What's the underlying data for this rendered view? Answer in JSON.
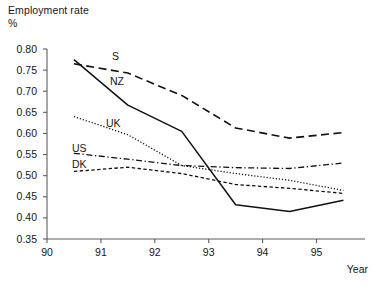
{
  "figure": {
    "title_line1": "Employment rate",
    "title_line2": "%",
    "xaxis_title": "Year"
  },
  "chart_data": {
    "type": "line",
    "title": "Employment rate",
    "subtitle": "%",
    "xlabel": "Year",
    "ylabel": "%",
    "xlim": [
      90,
      95.9
    ],
    "ylim": [
      0.35,
      0.8
    ],
    "grid": false,
    "legend": "inline-labels",
    "xticks": [
      90,
      91,
      92,
      93,
      94,
      95
    ],
    "xtick_labels": [
      "90",
      "91",
      "92",
      "93",
      "94",
      "95"
    ],
    "yticks": [
      0.35,
      0.4,
      0.45,
      0.5,
      0.55,
      0.6,
      0.65,
      0.7,
      0.75,
      0.8
    ],
    "ytick_labels": [
      "0.35",
      "0.40",
      "0.45",
      "0.50",
      "0.55",
      "0.60",
      "0.65",
      "0.70",
      "0.75",
      "0.80"
    ],
    "x": [
      90.5,
      91.5,
      92.5,
      93.5,
      94.5,
      95.5
    ],
    "series": [
      {
        "name": "S",
        "label": "S",
        "style": "dashed",
        "color": "#111111",
        "values": [
          0.765,
          0.743,
          0.69,
          0.613,
          0.589,
          0.602
        ]
      },
      {
        "name": "NZ",
        "label": "NZ",
        "style": "solid",
        "color": "#111111",
        "values": [
          0.775,
          0.667,
          0.605,
          0.431,
          0.415,
          0.442
        ]
      },
      {
        "name": "UK",
        "label": "UK",
        "style": "dotted",
        "color": "#111111",
        "values": [
          0.64,
          0.597,
          0.524,
          0.505,
          0.489,
          0.465
        ]
      },
      {
        "name": "US",
        "label": "US",
        "style": "dash-dot",
        "color": "#111111",
        "values": [
          0.553,
          0.539,
          0.524,
          0.519,
          0.517,
          0.53
        ]
      },
      {
        "name": "DK",
        "label": "DK",
        "style": "dashed-short",
        "color": "#111111",
        "values": [
          0.51,
          0.52,
          0.505,
          0.479,
          0.47,
          0.458
        ]
      }
    ],
    "series_label_positions": [
      {
        "name": "S",
        "x": 112,
        "y": 60
      },
      {
        "name": "NZ",
        "x": 110,
        "y": 85
      },
      {
        "name": "UK",
        "x": 106,
        "y": 127
      },
      {
        "name": "US",
        "x": 72,
        "y": 152
      },
      {
        "name": "DK",
        "x": 72,
        "y": 168
      }
    ]
  }
}
